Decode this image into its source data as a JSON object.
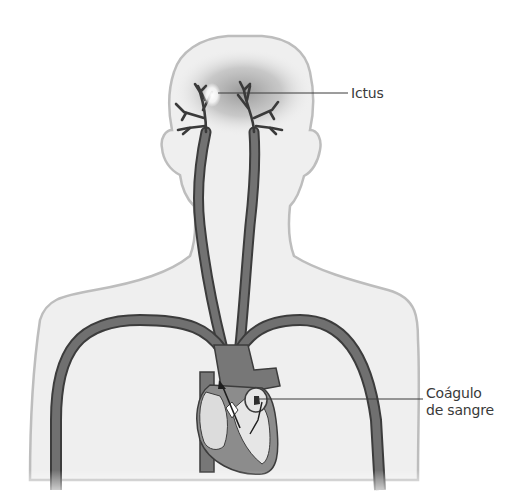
{
  "diagram": {
    "labels": {
      "stroke": "Ictus",
      "clot_line1": "Coágulo",
      "clot_line2": "de sangre"
    },
    "colors": {
      "body_fill": "#efefef",
      "body_outline": "#b8b8b8",
      "artery": "#6f6f6f",
      "artery_edge": "#3c3c3c",
      "leader_line": "#3a3a3a",
      "text": "#3a3a3a",
      "stroke_glow": "#ffffff"
    }
  }
}
